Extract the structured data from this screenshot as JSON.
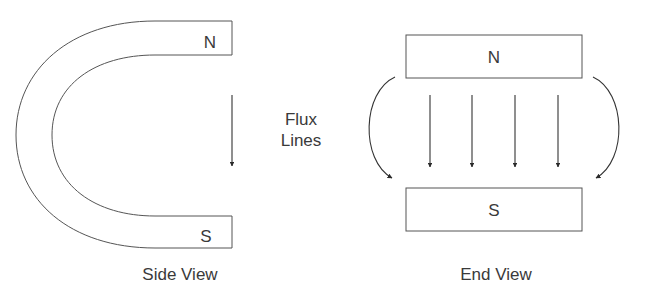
{
  "diagram": {
    "side_view": {
      "caption": "Side View",
      "north_label": "N",
      "south_label": "S"
    },
    "flux_label": {
      "line1": "Flux",
      "line2": "Lines"
    },
    "end_view": {
      "caption": "End View",
      "north_label": "N",
      "south_label": "S",
      "straight_arrow_count": 4,
      "curved_arrow_count": 2
    },
    "colors": {
      "stroke": "#3a3a3a",
      "background": "#ffffff"
    }
  }
}
